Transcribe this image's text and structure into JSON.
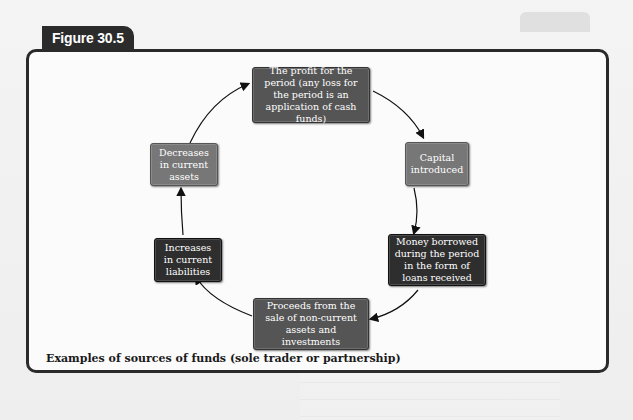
{
  "figure": {
    "label": "Figure 30.5",
    "caption": "Examples of sources of funds (sole trader or partnership)"
  },
  "nodes": [
    {
      "id": "profit",
      "text": "The profit for the period (any loss for the period is an application of cash funds)",
      "shade": "mid"
    },
    {
      "id": "capital",
      "text": "Capital introduced",
      "shade": "light"
    },
    {
      "id": "loans",
      "text": "Money borrowed during the period in the form of loans received",
      "shade": "dark"
    },
    {
      "id": "proceeds",
      "text": "Proceeds from the sale of non-current assets and investments",
      "shade": "mid"
    },
    {
      "id": "liabilities",
      "text": "Increases in current liabilities",
      "shade": "dark"
    },
    {
      "id": "assets",
      "text": "Decreases in current assets",
      "shade": "light"
    }
  ],
  "flow": [
    "profit",
    "capital",
    "loans",
    "proceeds",
    "liabilities",
    "assets",
    "profit"
  ],
  "colors": {
    "frame": "#2a2a2a",
    "tab": "#2b2b2b",
    "dark_box": "#2e2e2e",
    "mid_box": "#555555",
    "light_box": "#777777"
  }
}
